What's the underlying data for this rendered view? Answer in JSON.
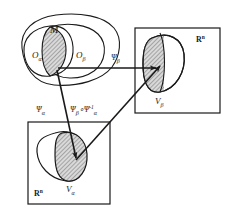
{
  "diagram": {
    "colors": {
      "stroke": "#1a1a1a",
      "background": "#ffffff",
      "hatch": "#8c8c8c",
      "hatch_fill": "#cfcfcf"
    },
    "manifold": {
      "name": "manifold-region",
      "label": "M",
      "open_set_alpha": "O",
      "open_set_alpha_sub": "α",
      "open_set_beta": "O",
      "open_set_beta_sub": "β"
    },
    "codomain_boxes": [
      {
        "name": "euclidean-space-beta",
        "label_base": "R",
        "label_exp": "n",
        "region_base": "V",
        "region_sub": "β"
      },
      {
        "name": "euclidean-space-alpha",
        "label_base": "R",
        "label_exp": "n",
        "region_base": "V",
        "region_sub": "α"
      }
    ],
    "maps": [
      {
        "name": "chart-map-beta",
        "base": "Ψ",
        "sub": "β",
        "description": "horizontal arrow from manifold overlap to V beta"
      },
      {
        "name": "chart-map-alpha",
        "base": "Ψ",
        "sub": "α",
        "description": "downward arrow from manifold overlap to V alpha"
      },
      {
        "name": "transition-map",
        "text_part1": "Ψ",
        "text_sub1": "β",
        "text_circ": "∘",
        "text_part2": "Ψ",
        "text_sub2": "α",
        "text_sup2": "-1",
        "description": "diagonal arrow from V alpha to V beta"
      }
    ]
  }
}
